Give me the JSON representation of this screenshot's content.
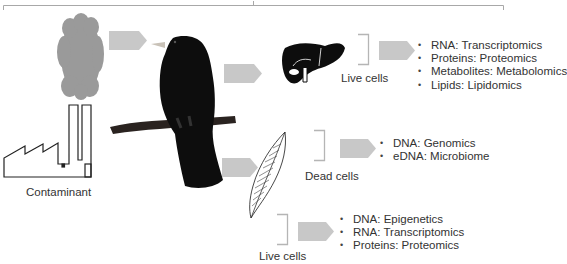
{
  "colors": {
    "arrow": "#c8c8c8",
    "cloud": "#9a9a9a",
    "bracket": "#b5b5b5",
    "silhouette": "#0d0d0d",
    "text": "#333333"
  },
  "top_bracket": {
    "icon": "bracket-line"
  },
  "source": {
    "cloud_icon": "pollution-cloud",
    "factory_icon": "factory",
    "label": "Contaminant"
  },
  "organism": {
    "icon": "bird-on-branch"
  },
  "branches": [
    {
      "tissue_icon": "liver",
      "cell_label": "Live cells",
      "items": [
        "RNA: Transcriptomics",
        "Proteins: Proteomics",
        "Metabolites: Metabolomics",
        "Lipids: Lipidomics"
      ]
    },
    {
      "tissue_icon": "feather",
      "cell_label": "Dead cells",
      "items": [
        "DNA: Genomics",
        "eDNA: Microbiome"
      ]
    },
    {
      "tissue_icon": "feather",
      "cell_label": "Live cells",
      "items": [
        "DNA: Epigenetics",
        "RNA: Transcriptomics",
        "Proteins: Proteomics"
      ]
    }
  ]
}
